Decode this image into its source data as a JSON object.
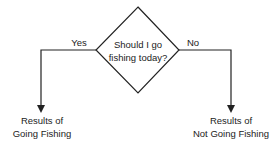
{
  "diagram": {
    "type": "flowchart-decision",
    "decision": {
      "line1": "Should I go",
      "line2": "fishing today?"
    },
    "branches": [
      {
        "label": "Yes",
        "result_line1": "Results of",
        "result_line2": "Going Fishing",
        "direction": "left"
      },
      {
        "label": "No",
        "result_line1": "Results of",
        "result_line2": "Not Going Fishing",
        "direction": "right"
      }
    ],
    "colors": {
      "line": "#222222",
      "text": "#222222",
      "background": "#ffffff"
    }
  }
}
